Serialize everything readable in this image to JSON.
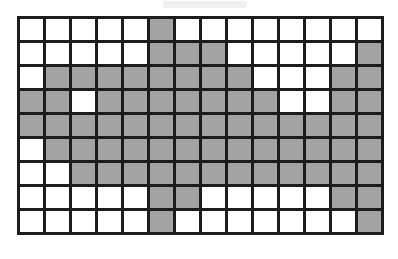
{
  "page": {
    "background_color": "#ffffff"
  },
  "artifact": {
    "name": "top-bar-artifact",
    "color": "#f0f0f0",
    "visible": true
  },
  "grid": {
    "columns": 14,
    "rows": 9,
    "cell_width_px": 23,
    "cell_height_px": 21,
    "line_width_px": 3,
    "line_color": "#1c1c1c",
    "filled_color": "#a3a3a3",
    "empty_color": "#ffffff",
    "filled_count": 94,
    "empty_count": 32,
    "legend": {
      "filled_label": "filled",
      "empty_label": "empty"
    },
    "cells": [
      [
        0,
        0,
        0,
        0,
        0,
        1,
        0,
        0,
        0,
        0,
        0,
        0,
        0,
        0
      ],
      [
        0,
        0,
        0,
        0,
        0,
        1,
        1,
        1,
        0,
        0,
        0,
        0,
        0,
        1
      ],
      [
        0,
        1,
        1,
        1,
        1,
        1,
        1,
        1,
        1,
        0,
        0,
        0,
        1,
        1
      ],
      [
        1,
        1,
        0,
        1,
        1,
        1,
        1,
        1,
        1,
        1,
        0,
        0,
        1,
        1
      ],
      [
        1,
        1,
        1,
        1,
        1,
        1,
        1,
        1,
        1,
        1,
        1,
        1,
        1,
        1
      ],
      [
        0,
        1,
        1,
        1,
        1,
        1,
        1,
        1,
        1,
        1,
        1,
        1,
        1,
        1
      ],
      [
        0,
        0,
        1,
        1,
        1,
        1,
        1,
        1,
        1,
        1,
        1,
        1,
        1,
        1
      ],
      [
        0,
        0,
        0,
        0,
        0,
        1,
        1,
        0,
        0,
        0,
        0,
        0,
        1,
        1
      ],
      [
        0,
        0,
        0,
        0,
        0,
        1,
        0,
        0,
        0,
        0,
        0,
        0,
        0,
        1
      ]
    ]
  }
}
